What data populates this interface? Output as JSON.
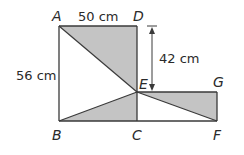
{
  "diagram": {
    "title": "",
    "colors": {
      "stroke": "#3a3a3a",
      "shade": "#c4c4c4",
      "background": "#ffffff"
    },
    "points": {
      "A": {
        "label": "A",
        "x": 59,
        "y": 26
      },
      "D": {
        "label": "D",
        "x": 137,
        "y": 26
      },
      "B": {
        "label": "B",
        "x": 59,
        "y": 121
      },
      "C": {
        "label": "C",
        "x": 137,
        "y": 121
      },
      "E": {
        "label": "E",
        "x": 137,
        "y": 92
      },
      "G": {
        "label": "G",
        "x": 217,
        "y": 92
      },
      "F": {
        "label": "F",
        "x": 217,
        "y": 121
      }
    },
    "measurements": {
      "AD": "50 cm",
      "AB": "56 cm",
      "DE": "42 cm"
    },
    "shaded_regions": [
      "triangle ADE",
      "triangle BCE",
      "triangle EGF"
    ]
  }
}
